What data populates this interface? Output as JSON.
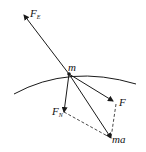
{
  "diagram": {
    "type": "force-diagram",
    "labels": {
      "mass": "m",
      "electric_force": "F",
      "electric_force_sub": "E",
      "force": "F",
      "normal_force": "F",
      "normal_force_sub": "N",
      "net_force": "ma"
    },
    "colors": {
      "line": "#1a1a1a",
      "background": "#ffffff"
    }
  }
}
